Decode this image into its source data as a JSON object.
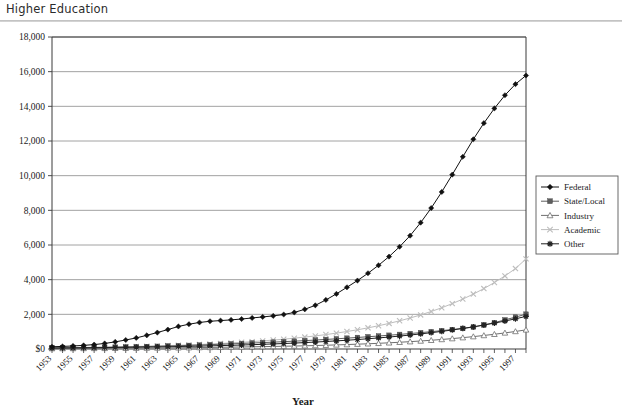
{
  "document": {
    "title": "Higher Education"
  },
  "chart_data": {
    "type": "line",
    "title": "Higher Education",
    "xlabel": "Year",
    "ylabel": "",
    "grid": true,
    "legend_position": "right",
    "xlim": [
      1953,
      1998
    ],
    "ylim": [
      0,
      18000
    ],
    "ytick_values": [
      0,
      2000,
      4000,
      6000,
      8000,
      10000,
      12000,
      14000,
      16000,
      18000
    ],
    "ytick_labels": [
      "$0",
      "2,000",
      "4,000",
      "6,000",
      "8,000",
      "10,000",
      "12,000",
      "14,000",
      "16,000",
      "18,000"
    ],
    "xtick_labels": [
      "1953",
      "1955",
      "1957",
      "1959",
      "1961",
      "1963",
      "1965",
      "1967",
      "1969",
      "1971",
      "1973",
      "1975",
      "1977",
      "1979",
      "1981",
      "1983",
      "1985",
      "1987",
      "1989",
      "1991",
      "1993",
      "1995",
      "1997"
    ],
    "x": [
      1953,
      1954,
      1955,
      1956,
      1957,
      1958,
      1959,
      1960,
      1961,
      1962,
      1963,
      1964,
      1965,
      1966,
      1967,
      1968,
      1969,
      1970,
      1971,
      1972,
      1973,
      1974,
      1975,
      1976,
      1977,
      1978,
      1979,
      1980,
      1981,
      1982,
      1983,
      1984,
      1985,
      1986,
      1987,
      1988,
      1989,
      1990,
      1991,
      1992,
      1993,
      1994,
      1995,
      1996,
      1997,
      1998
    ],
    "series": [
      {
        "name": "Federal",
        "marker": "diamond",
        "color": "#111111",
        "values": [
          130,
          150,
          175,
          210,
          255,
          320,
          410,
          520,
          640,
          790,
          950,
          1120,
          1300,
          1430,
          1530,
          1600,
          1640,
          1680,
          1730,
          1790,
          1850,
          1910,
          1990,
          2110,
          2290,
          2520,
          2830,
          3180,
          3560,
          3950,
          4370,
          4830,
          5330,
          5900,
          6540,
          7290,
          8130,
          9060,
          10060,
          11090,
          12100,
          13030,
          13880,
          14640,
          15280,
          15780
        ]
      },
      {
        "name": "State/Local",
        "marker": "square",
        "color": "#5d5d5d",
        "values": [
          60,
          65,
          70,
          78,
          86,
          95,
          105,
          116,
          128,
          142,
          157,
          172,
          190,
          208,
          228,
          250,
          273,
          296,
          320,
          345,
          370,
          396,
          423,
          452,
          483,
          516,
          551,
          588,
          626,
          666,
          707,
          750,
          795,
          842,
          892,
          944,
          1000,
          1060,
          1123,
          1190,
          1262,
          1390,
          1520,
          1680,
          1840,
          2010
        ]
      },
      {
        "name": "Industry",
        "marker": "triangle",
        "color": "#6f6f6f",
        "values": [
          25,
          27,
          29,
          32,
          35,
          38,
          42,
          46,
          50,
          55,
          60,
          65,
          71,
          77,
          84,
          91,
          99,
          107,
          116,
          126,
          136,
          147,
          159,
          172,
          186,
          201,
          218,
          236,
          256,
          278,
          302,
          328,
          357,
          389,
          424,
          462,
          504,
          550,
          600,
          655,
          715,
          780,
          851,
          928,
          1012,
          1104
        ]
      },
      {
        "name": "Academic",
        "marker": "x",
        "color": "#bdbdbd",
        "values": [
          70,
          76,
          83,
          91,
          100,
          110,
          121,
          133,
          147,
          162,
          178,
          196,
          216,
          238,
          262,
          289,
          318,
          350,
          386,
          425,
          468,
          515,
          567,
          624,
          687,
          756,
          832,
          916,
          1008,
          1109,
          1220,
          1342,
          1477,
          1625,
          1788,
          1967,
          2164,
          2380,
          2618,
          2880,
          3168,
          3485,
          3834,
          4217,
          4639,
          5200
        ]
      },
      {
        "name": "Other",
        "marker": "asterisk",
        "color": "#222222",
        "values": [
          55,
          59,
          64,
          69,
          75,
          81,
          88,
          95,
          103,
          112,
          121,
          131,
          142,
          154,
          167,
          181,
          196,
          212,
          230,
          249,
          270,
          292,
          316,
          342,
          370,
          400,
          433,
          468,
          506,
          547,
          591,
          639,
          690,
          746,
          806,
          871,
          941,
          1016,
          1098,
          1186,
          1281,
          1383,
          1494,
          1613,
          1742,
          1881
        ]
      }
    ]
  }
}
